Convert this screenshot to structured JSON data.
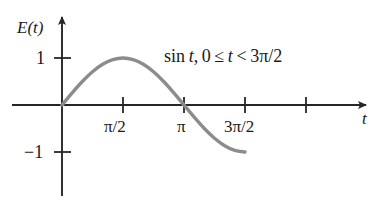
{
  "chart_data": {
    "type": "line",
    "title": "",
    "xlabel": "t",
    "ylabel": "E(t)",
    "annotation": "sin t, 0 ≤ t < 3π/2",
    "annotation_parts": {
      "function": "sin",
      "variable": "t",
      "comma": ",",
      "lower_bound": "0",
      "le": "≤",
      "lt": "<",
      "upper_bound": "3π/2"
    },
    "grid": false,
    "legend": false,
    "curve_color": "#8c8c8c",
    "axis_color": "#262626",
    "text_color": "#1a1a1a",
    "xlim": [
      -1.0,
      7.6
    ],
    "ylim": [
      -2.35,
      2.4
    ],
    "xticks": [
      {
        "value": 1.5708,
        "label": "π/2"
      },
      {
        "value": 3.14159,
        "label": "π"
      },
      {
        "value": 4.71239,
        "label": "3π/2"
      },
      {
        "value": 6.28319,
        "label": ""
      }
    ],
    "yticks": [
      {
        "value": 1,
        "label": "1"
      },
      {
        "value": -1,
        "label": "−1"
      }
    ],
    "series": [
      {
        "name": "sin t",
        "domain": [
          0,
          4.71239
        ],
        "x": [
          0.0,
          0.2618,
          0.5236,
          0.7854,
          1.0472,
          1.309,
          1.5708,
          1.8326,
          2.0944,
          2.3562,
          2.618,
          2.8798,
          3.1416,
          3.4034,
          3.6652,
          3.927,
          4.1888,
          4.4506,
          4.7124
        ],
        "y": [
          0.0,
          0.2588,
          0.5,
          0.7071,
          0.866,
          0.9659,
          1.0,
          0.9659,
          0.866,
          0.7071,
          0.5,
          0.2588,
          0.0,
          -0.2588,
          -0.5,
          -0.7071,
          -0.866,
          -0.9659,
          -1.0
        ]
      }
    ]
  },
  "axes": {
    "y_axis_name": "E(t)",
    "x_axis_name": "t"
  }
}
